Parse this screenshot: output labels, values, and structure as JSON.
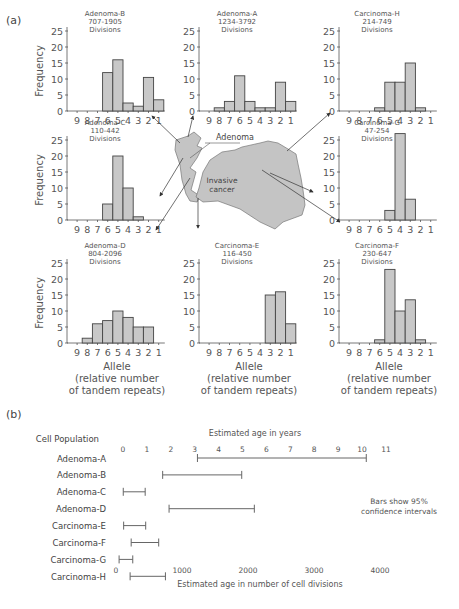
{
  "panel_a_label": "(a)",
  "panel_b_label": "(b)",
  "common": {
    "ylabel": "Frequency",
    "xlabel_lines": [
      "Allele",
      "(relative number",
      "of tandem repeats)"
    ],
    "allele_ticks": [
      "9",
      "8",
      "7",
      "6",
      "5",
      "4",
      "3",
      "2",
      "1"
    ],
    "y_ticks": [
      "0",
      "5",
      "10",
      "15",
      "20",
      "25"
    ],
    "bar_fill": "#c8c8c8",
    "bar_stroke": "#444444"
  },
  "diagram": {
    "adenoma_label": "Adenoma",
    "cancer_label_lines": [
      "Invasive",
      "cancer"
    ],
    "tissue_fill": "#c4c4c4"
  },
  "chart_data": [
    {
      "type": "bar",
      "title": "Adenoma-B",
      "subtitle_lines": [
        "707-1905",
        "Divisions"
      ],
      "categories": [
        "9",
        "8",
        "7",
        "6",
        "5",
        "4",
        "3",
        "2",
        "1"
      ],
      "values": [
        0,
        0,
        0,
        12,
        16,
        2.5,
        1.5,
        10.5,
        3.5
      ],
      "xlabel": "",
      "ylabel": "Frequency",
      "ylim": [
        0,
        25
      ]
    },
    {
      "type": "bar",
      "title": "Adenoma-A",
      "subtitle_lines": [
        "1234-3792",
        "Divisions"
      ],
      "categories": [
        "9",
        "8",
        "7",
        "6",
        "5",
        "4",
        "3",
        "2",
        "1"
      ],
      "values": [
        0,
        1,
        3,
        11,
        3,
        1,
        1,
        9,
        3
      ],
      "xlabel": "",
      "ylabel": "",
      "ylim": [
        0,
        25
      ]
    },
    {
      "type": "bar",
      "title": "Carcinoma-H",
      "subtitle_lines": [
        "214-749",
        "Divisions"
      ],
      "categories": [
        "9",
        "8",
        "7",
        "6",
        "5",
        "4",
        "3",
        "2",
        "1"
      ],
      "values": [
        0,
        0,
        0,
        1,
        9,
        9,
        15,
        1,
        0
      ],
      "xlabel": "",
      "ylabel": "",
      "ylim": [
        0,
        25
      ]
    },
    {
      "type": "bar",
      "title": "Adenoma-C",
      "subtitle_lines": [
        "110-442",
        "Divisions"
      ],
      "categories": [
        "9",
        "8",
        "7",
        "6",
        "5",
        "4",
        "3",
        "2",
        "1"
      ],
      "values": [
        0,
        0,
        0,
        5,
        20,
        10,
        1,
        0,
        0
      ],
      "xlabel": "",
      "ylabel": "Frequency",
      "ylim": [
        0,
        25
      ]
    },
    {
      "type": "bar",
      "title": "Carcinoma-G",
      "subtitle_lines": [
        "47-254",
        "Divisions"
      ],
      "categories": [
        "9",
        "8",
        "7",
        "6",
        "5",
        "4",
        "3",
        "2",
        "1"
      ],
      "values": [
        0,
        0,
        0,
        0,
        3,
        27,
        6.5,
        0,
        0
      ],
      "xlabel": "",
      "ylabel": "",
      "ylim": [
        0,
        25
      ]
    },
    {
      "type": "bar",
      "title": "Adenoma-D",
      "subtitle_lines": [
        "804-2096",
        "Divisions"
      ],
      "categories": [
        "9",
        "8",
        "7",
        "6",
        "5",
        "4",
        "3",
        "2",
        "1"
      ],
      "values": [
        0,
        1.5,
        6,
        7,
        10,
        8,
        5,
        5,
        0
      ],
      "xlabel": "Allele (relative number of tandem repeats)",
      "ylabel": "Frequency",
      "ylim": [
        0,
        25
      ]
    },
    {
      "type": "bar",
      "title": "Carcinoma-E",
      "subtitle_lines": [
        "116-450",
        "Divisions"
      ],
      "categories": [
        "9",
        "8",
        "7",
        "6",
        "5",
        "4",
        "3",
        "2",
        "1"
      ],
      "values": [
        0,
        0,
        0,
        0,
        0,
        0,
        15,
        16,
        6
      ],
      "xlabel": "Allele (relative number of tandem repeats)",
      "ylabel": "",
      "ylim": [
        0,
        25
      ]
    },
    {
      "type": "bar",
      "title": "Carcinoma-F",
      "subtitle_lines": [
        "230-647",
        "Divisions"
      ],
      "categories": [
        "9",
        "8",
        "7",
        "6",
        "5",
        "4",
        "3",
        "2",
        "1"
      ],
      "values": [
        0,
        0,
        0,
        1,
        23,
        10,
        13.5,
        1,
        0
      ],
      "xlabel": "Allele (relative number of tandem repeats)",
      "ylabel": "",
      "ylim": [
        0,
        25
      ]
    },
    {
      "type": "range",
      "title": "",
      "ylabel": "Cell Population",
      "categories": [
        "Adenoma-A",
        "Adenoma-B",
        "Adenoma-C",
        "Adenoma-D",
        "Carcinoma-E",
        "Carcinoma-F",
        "Carcinoma-G",
        "Carcinoma-H"
      ],
      "ranges": [
        [
          1234,
          3792
        ],
        [
          707,
          1905
        ],
        [
          110,
          442
        ],
        [
          804,
          2096
        ],
        [
          116,
          450
        ],
        [
          230,
          647
        ],
        [
          47,
          254
        ],
        [
          214,
          749
        ]
      ],
      "xlabel": "Estimated age in number of cell divisions",
      "x_ticks": [
        "0",
        "1000",
        "2000",
        "3000",
        "4000"
      ],
      "xlim": [
        0,
        4200
      ],
      "top_axis_label": "Estimated age in years",
      "top_ticks": [
        "0",
        "1",
        "2",
        "3",
        "4",
        "5",
        "6",
        "7",
        "8",
        "9",
        "10",
        "11"
      ],
      "annotation_lines": [
        "Bars show 95%",
        "confidence intervals"
      ],
      "grid": false
    }
  ]
}
